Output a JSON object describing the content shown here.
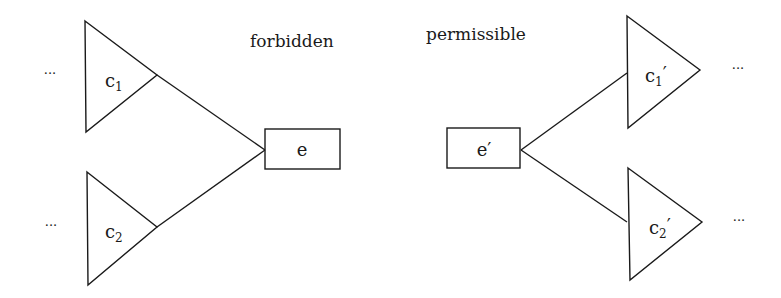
{
  "left": {
    "title": "forbidden",
    "node": "e",
    "children": [
      {
        "base": "c",
        "sub": "1",
        "prime": "",
        "ellipsis": "···"
      },
      {
        "base": "c",
        "sub": "2",
        "prime": "",
        "ellipsis": "···"
      }
    ]
  },
  "right": {
    "title": "permissible",
    "node": "e′",
    "children": [
      {
        "base": "c",
        "sub": "1",
        "prime": "′",
        "ellipsis": "···"
      },
      {
        "base": "c",
        "sub": "2",
        "prime": "′",
        "ellipsis": "···"
      }
    ]
  },
  "colors": {
    "stroke": "#1a1a1a",
    "background": "#ffffff"
  }
}
